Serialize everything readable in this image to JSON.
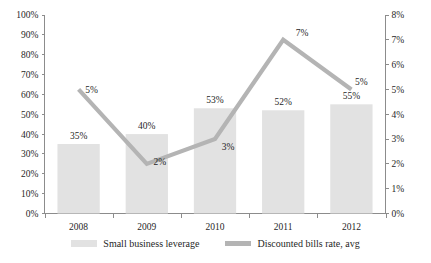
{
  "chart_data": {
    "type": "bar",
    "title": "",
    "subtitle": "",
    "xlabel": "",
    "ylabel": "",
    "categories": [
      "2008",
      "2009",
      "2010",
      "2011",
      "2012"
    ],
    "series": [
      {
        "name": "Small business leverage",
        "type": "bar",
        "axis": "left",
        "color": "#e2e2e2",
        "values": [
          35,
          40,
          53,
          52,
          55
        ],
        "data_labels": [
          "35%",
          "40%",
          "53%",
          "52%",
          "55%"
        ]
      },
      {
        "name": "Discounted bills rate, avg",
        "type": "line",
        "axis": "right",
        "color": "#b4b4b4",
        "values": [
          5,
          2,
          3,
          7,
          5
        ],
        "data_labels": [
          "5%",
          "2%",
          "3%",
          "7%",
          "5%"
        ]
      }
    ],
    "left_axis": {
      "min": 0,
      "max": 100,
      "step": 10,
      "unit": "%",
      "tick_labels": [
        "0%",
        "10%",
        "20%",
        "30%",
        "40%",
        "50%",
        "60%",
        "70%",
        "80%",
        "90%",
        "100%"
      ]
    },
    "right_axis": {
      "min": 0,
      "max": 8,
      "step": 1,
      "unit": "%",
      "tick_labels": [
        "0%",
        "1%",
        "2%",
        "3%",
        "4%",
        "5%",
        "6%",
        "7%",
        "8%"
      ]
    },
    "grid": false,
    "legend_position": "bottom"
  },
  "legend": {
    "items": [
      {
        "label": "Small business leverage",
        "swatch": "bar-swatch"
      },
      {
        "label": "Discounted bills rate, avg",
        "swatch": "line-swatch"
      }
    ]
  },
  "colors": {
    "bar": "#e2e2e2",
    "line": "#b4b4b4",
    "axis": "#8c8c8c",
    "text": "#1f1f1f",
    "background": "#ffffff"
  }
}
